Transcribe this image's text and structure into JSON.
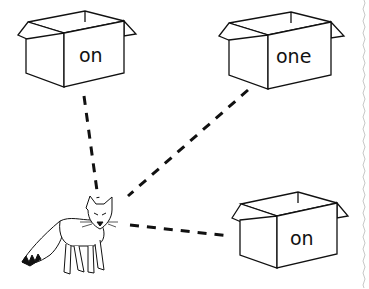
{
  "worksheet": {
    "boxes": [
      {
        "id": "box-top-left",
        "word": "on"
      },
      {
        "id": "box-top-right",
        "word": "one"
      },
      {
        "id": "box-bottom-right",
        "word": "on"
      }
    ],
    "character": "fox",
    "connector_style": "dashed",
    "colors": {
      "ink": "#111111",
      "background": "#ffffff",
      "border": "#cccccc"
    }
  }
}
